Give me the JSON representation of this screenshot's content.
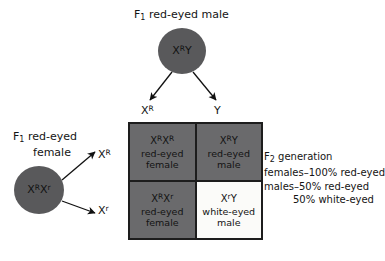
{
  "male_parent": {
    "label_prefix": "F",
    "label_sub": "1",
    "label_text": " red-eyed male",
    "genotype_x": "X",
    "genotype_sup": "R",
    "genotype_rest": "Y"
  },
  "female_parent": {
    "label_prefix": "F",
    "label_sub": "1",
    "label_line1": " red-eyed",
    "label_line2": "female",
    "genotype_x1": "X",
    "genotype_sup1": "R",
    "genotype_x2": "X",
    "genotype_sup2": "r"
  },
  "male_gametes": [
    {
      "base": "X",
      "sup": "R"
    },
    {
      "base": "Y",
      "sup": ""
    }
  ],
  "female_gametes": [
    {
      "base": "X",
      "sup": "R"
    },
    {
      "base": "X",
      "sup": "r"
    }
  ],
  "punnett_cells": [
    {
      "geno_b1": "X",
      "geno_s1": "R",
      "geno_b2": "X",
      "geno_s2": "R",
      "phenotype": "red-eyed",
      "sex": "female",
      "shaded": true
    },
    {
      "geno_b1": "X",
      "geno_s1": "R",
      "geno_b2": "Y",
      "geno_s2": "",
      "phenotype": "red-eyed",
      "sex": "male",
      "shaded": true
    },
    {
      "geno_b1": "X",
      "geno_s1": "R",
      "geno_b2": "X",
      "geno_s2": "r",
      "phenotype": "red-eyed",
      "sex": "female",
      "shaded": true
    },
    {
      "geno_b1": "X",
      "geno_s1": "r",
      "geno_b2": "Y",
      "geno_s2": "",
      "phenotype": "white-eyed",
      "sex": "male",
      "shaded": false
    }
  ],
  "f2_summary": {
    "line1_prefix": "F",
    "line1_sub": "2",
    "line1_rest": " generation",
    "line2": "females–100% red-eyed",
    "line3": "males–50% red-eyed",
    "line4": "50% white-eyed"
  },
  "colors": {
    "shaded_cell": "#6a6a6c",
    "plain_cell": "#fbfbf9",
    "circle_fill": "#59595b",
    "border": "#1d1d1d",
    "text": "#141414"
  }
}
